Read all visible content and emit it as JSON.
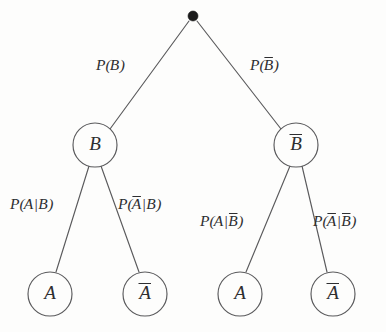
{
  "diagram": {
    "type": "probability-tree",
    "background_color": "#fdfdfc",
    "stroke_color": "#5a5a5c",
    "text_color": "#2e2e30",
    "root": {
      "name": "root-node",
      "shape": "filled-dot",
      "label": "",
      "x": 193,
      "y": 16,
      "radius": 5
    },
    "levels": [
      {
        "level": 1,
        "nodes": [
          {
            "id": "node-b",
            "label": "B",
            "overbar": false,
            "x": 95,
            "y": 145,
            "radius": 22
          },
          {
            "id": "node-bbar",
            "label": "B",
            "overbar": true,
            "x": 296,
            "y": 145,
            "radius": 22
          }
        ]
      },
      {
        "level": 2,
        "nodes": [
          {
            "id": "leaf-a-given-b",
            "label": "A",
            "overbar": false,
            "x": 50,
            "y": 294,
            "radius": 22
          },
          {
            "id": "leaf-abar-given-b",
            "label": "A",
            "overbar": true,
            "x": 145,
            "y": 294,
            "radius": 22
          },
          {
            "id": "leaf-a-given-bbar",
            "label": "A",
            "overbar": false,
            "x": 240,
            "y": 294,
            "radius": 22
          },
          {
            "id": "leaf-abar-given-bbar",
            "label": "A",
            "overbar": true,
            "x": 333,
            "y": 294,
            "radius": 22
          }
        ]
      }
    ],
    "edges": [
      {
        "id": "edge-root-to-b",
        "from": "root-node",
        "to": "node-b",
        "label_id": "label-p-b",
        "x1": 189,
        "y1": 21,
        "x2": 110,
        "y2": 129
      },
      {
        "id": "edge-root-to-bbar",
        "from": "root-node",
        "to": "node-bbar",
        "label_id": "label-p-bbar",
        "x1": 197,
        "y1": 21,
        "x2": 281,
        "y2": 129
      },
      {
        "id": "edge-b-to-a",
        "from": "node-b",
        "to": "leaf-a-given-b",
        "label_id": "label-p-a-given-b",
        "x1": 89,
        "y1": 166,
        "x2": 56,
        "y2": 272
      },
      {
        "id": "edge-b-to-abar",
        "from": "node-b",
        "to": "leaf-abar-given-b",
        "label_id": "label-p-abar-given-b",
        "x1": 101,
        "y1": 166,
        "x2": 139,
        "y2": 272
      },
      {
        "id": "edge-bbar-to-a",
        "from": "node-bbar",
        "to": "leaf-a-given-bbar",
        "label_id": "label-p-a-given-bbar",
        "x1": 290,
        "y1": 166,
        "x2": 246,
        "y2": 272
      },
      {
        "id": "edge-bbar-to-abar",
        "from": "node-bbar",
        "to": "leaf-abar-given-bbar",
        "label_id": "label-p-abar-given-bbar",
        "x1": 302,
        "y1": 166,
        "x2": 327,
        "y2": 272
      }
    ],
    "edge_labels": [
      {
        "id": "label-p-b",
        "text": "P(B)",
        "plain": "P(B)",
        "prefix": "P(",
        "var": "B",
        "var_overbar": false,
        "given": "",
        "given_overbar": false,
        "suffix": ")",
        "x": 96,
        "y": 66
      },
      {
        "id": "label-p-bbar",
        "text": "P(B̅)",
        "plain": "P(Bbar)",
        "prefix": "P(",
        "var": "B",
        "var_overbar": true,
        "given": "",
        "given_overbar": false,
        "suffix": ")",
        "x": 250,
        "y": 66
      },
      {
        "id": "label-p-a-given-b",
        "text": "P(A|B)",
        "plain": "P(A|B)",
        "prefix": "P(",
        "var": "A",
        "var_overbar": false,
        "given": "B",
        "given_overbar": false,
        "suffix": ")",
        "x": 10,
        "y": 205
      },
      {
        "id": "label-p-abar-given-b",
        "text": "P(A̅|B)",
        "plain": "P(Abar|B)",
        "prefix": "P(",
        "var": "A",
        "var_overbar": true,
        "given": "B",
        "given_overbar": false,
        "suffix": ")",
        "x": 118,
        "y": 205
      },
      {
        "id": "label-p-a-given-bbar",
        "text": "P(A|B̅)",
        "plain": "P(A|Bbar)",
        "prefix": "P(",
        "var": "A",
        "var_overbar": false,
        "given": "B",
        "given_overbar": true,
        "suffix": ")",
        "x": 200,
        "y": 222
      },
      {
        "id": "label-p-abar-given-bbar",
        "text": "P(A̅|B̅)",
        "plain": "P(Abar|Bbar)",
        "prefix": "P(",
        "var": "A",
        "var_overbar": true,
        "given": "B",
        "given_overbar": true,
        "suffix": ")",
        "x": 313,
        "y": 222
      }
    ]
  }
}
